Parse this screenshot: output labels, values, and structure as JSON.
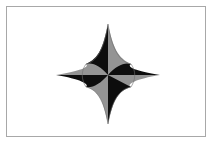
{
  "image": {
    "title": "Four-pointed star emblem",
    "subject_name": "four-pointed-star",
    "description": "A black and gray four-pointed star with concave curved edges on a white field inside a thin gray rectangular frame.",
    "canvas": {
      "width": 214,
      "height": 145
    }
  },
  "colors": {
    "background": "#ffffff",
    "frame_border": "#a8a8a8",
    "star_dark": "#0d0d0d",
    "star_light": "#949494",
    "star_edge": "#6e6e6e"
  },
  "frame": {
    "name": "picture-frame",
    "left": 6,
    "top": 6,
    "width": 200,
    "height": 131,
    "border_width": 1
  },
  "star": {
    "name": "four-pointed-star",
    "point_count": 4,
    "center": {
      "x": 108,
      "y": 75
    },
    "tips": [
      {
        "label": "north",
        "x": 108,
        "y": 24
      },
      {
        "label": "east",
        "x": 160,
        "y": 75
      },
      {
        "label": "south",
        "x": 108,
        "y": 124
      },
      {
        "label": "west",
        "x": 56,
        "y": 75
      }
    ],
    "waist_radius": 22,
    "concavity": 0.42,
    "wedges": [
      {
        "label": "north-west-half",
        "shade": "dark"
      },
      {
        "label": "north-east-half",
        "shade": "light"
      },
      {
        "label": "east-north-half",
        "shade": "dark"
      },
      {
        "label": "east-south-half",
        "shade": "light"
      },
      {
        "label": "south-east-half",
        "shade": "dark"
      },
      {
        "label": "south-west-half",
        "shade": "light"
      },
      {
        "label": "west-south-half",
        "shade": "dark"
      },
      {
        "label": "west-north-half",
        "shade": "light"
      }
    ]
  }
}
